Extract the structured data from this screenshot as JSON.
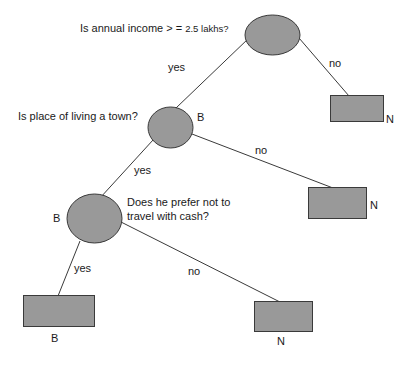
{
  "diagram": {
    "type": "decision-tree",
    "colors": {
      "node_fill": "#999999",
      "node_stroke": "#3a3a3a",
      "edge": "#3a3a3a",
      "text": "#1a1a1a",
      "background": "#ffffff"
    },
    "nodes": {
      "root": {
        "shape": "ellipse",
        "question_main": "Is annual income > = ",
        "question_tail": "2.5 lakhs?"
      },
      "leaf_root_no": {
        "shape": "rectangle",
        "label": "N"
      },
      "town": {
        "shape": "ellipse",
        "question": "Is place of living a town?",
        "label": "B"
      },
      "leaf_town_no": {
        "shape": "rectangle",
        "label": "N"
      },
      "cash": {
        "shape": "ellipse",
        "question_line1": "Does he prefer not to",
        "question_line2": "travel with cash?",
        "label": "B"
      },
      "leaf_cash_yes": {
        "shape": "rectangle",
        "label": "B"
      },
      "leaf_cash_no": {
        "shape": "rectangle",
        "label": "N"
      }
    },
    "edges": {
      "root_yes": "yes",
      "root_no": "no",
      "town_yes": "yes",
      "town_no": "no",
      "cash_yes": "yes",
      "cash_no": "no"
    }
  }
}
